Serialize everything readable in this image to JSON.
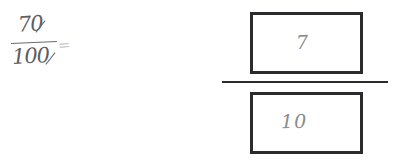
{
  "canvas": {
    "width": 398,
    "height": 166,
    "background": "#ffffff",
    "ink_color": "#5d5d62",
    "box_border_color": "#2b2b2e",
    "faint_ink_color": "#8a8a8f"
  },
  "problem": {
    "handwritten_fraction": {
      "numerator": "70",
      "denominator": "100",
      "equals_sign": "="
    },
    "answer": {
      "numerator_box_value": "7",
      "denominator_box_value": "10"
    }
  }
}
